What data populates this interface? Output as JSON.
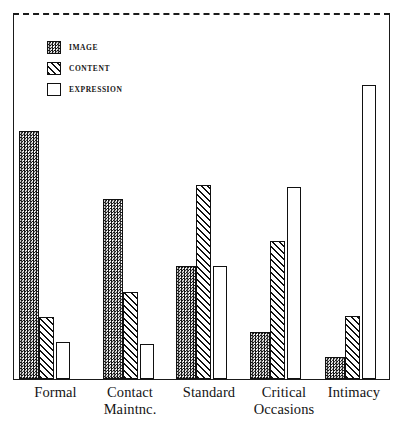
{
  "figure": {
    "frame": {
      "style": "solid-sides-dashed-top",
      "color": "#1a1a1a"
    }
  },
  "legend": {
    "items": [
      {
        "label": "IMAGE",
        "pattern": "checker-stipple",
        "swatch_name": "legend-swatch-image"
      },
      {
        "label": "CONTENT",
        "pattern": "diagonal-hatch",
        "swatch_name": "legend-swatch-content"
      },
      {
        "label": "EXPRESSION",
        "pattern": "plain-white",
        "swatch_name": "legend-swatch-expression"
      }
    ]
  },
  "axis": {
    "categories": [
      "Formal",
      "Contact Maintnc.",
      "Standard",
      "Critical Occasions",
      "Intimacy"
    ],
    "category_lines": [
      [
        "Formal"
      ],
      [
        "Contact",
        "Maintnc."
      ],
      [
        "Standard"
      ],
      [
        "Critical",
        "Occasions"
      ],
      [
        "Intimacy"
      ]
    ]
  },
  "chart_data": {
    "type": "bar",
    "title": "",
    "subtitle": "",
    "xlabel": "",
    "ylabel": "",
    "grid": false,
    "legend_position": "top-left",
    "axis_ticks": false,
    "ylim": [
      0,
      100
    ],
    "categories": [
      "Formal",
      "Contact Maintnc.",
      "Standard",
      "Critical Occasions",
      "Intimacy"
    ],
    "series": [
      {
        "name": "IMAGE",
        "pattern": "checker-stipple",
        "values": [
          84,
          61,
          38,
          16,
          7
        ]
      },
      {
        "name": "CONTENT",
        "pattern": "diagonal-hatch",
        "values": [
          21,
          30,
          66,
          47,
          21
        ]
      },
      {
        "name": "EXPRESSION",
        "pattern": "plain-white",
        "values": [
          13,
          12,
          38,
          65,
          100
        ]
      }
    ],
    "value_units": "relative percent of maximum bar"
  },
  "layout": {
    "baseline_px": 365,
    "max_bar_px": 294,
    "groups": [
      {
        "name": "Formal",
        "bars": [
          {
            "x": 5,
            "w": 20,
            "h": 248
          },
          {
            "x": 25,
            "w": 15,
            "h": 62
          },
          {
            "x": 42,
            "w": 14,
            "h": 37
          }
        ]
      },
      {
        "name": "Contact Maintnc.",
        "bars": [
          {
            "x": 89,
            "w": 20,
            "h": 180
          },
          {
            "x": 109,
            "w": 15,
            "h": 87
          },
          {
            "x": 126,
            "w": 14,
            "h": 35
          }
        ]
      },
      {
        "name": "Standard",
        "bars": [
          {
            "x": 162,
            "w": 20,
            "h": 113
          },
          {
            "x": 182,
            "w": 15,
            "h": 194
          },
          {
            "x": 199,
            "w": 14,
            "h": 113
          }
        ]
      },
      {
        "name": "Critical Occasions",
        "bars": [
          {
            "x": 236,
            "w": 20,
            "h": 47
          },
          {
            "x": 256,
            "w": 15,
            "h": 138
          },
          {
            "x": 273,
            "w": 14,
            "h": 192
          }
        ]
      },
      {
        "name": "Intimacy",
        "bars": [
          {
            "x": 311,
            "w": 20,
            "h": 22
          },
          {
            "x": 331,
            "w": 15,
            "h": 63
          },
          {
            "x": 348,
            "w": 14,
            "h": 294
          }
        ]
      }
    ],
    "label_positions": [
      {
        "left": 13,
        "width": 85
      },
      {
        "left": 85,
        "width": 90
      },
      {
        "left": 165,
        "width": 88
      },
      {
        "left": 238,
        "width": 92
      },
      {
        "left": 312,
        "width": 84
      }
    ]
  }
}
